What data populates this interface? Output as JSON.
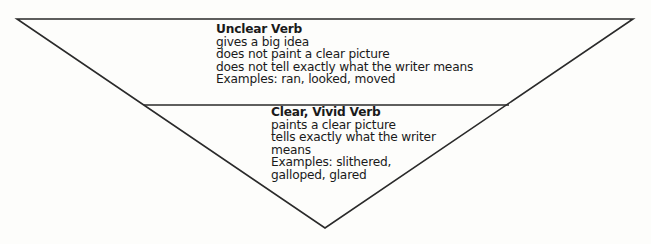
{
  "diagram": {
    "type": "inverted-triangle",
    "line_color": "#2a2a2a",
    "sections": [
      {
        "title": "Unclear Verb",
        "lines": [
          "gives a big idea",
          "does not paint a clear picture",
          "does not tell exactly what the writer means",
          "Examples: ran, looked, moved"
        ]
      },
      {
        "title": "Clear, Vivid Verb",
        "lines": [
          "paints a clear picture",
          "tells exactly what the writer",
          "means",
          "Examples: slithered,",
          "galloped, glared"
        ]
      }
    ]
  }
}
